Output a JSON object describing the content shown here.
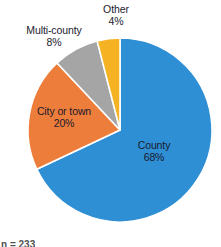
{
  "chart_data": {
    "type": "pie",
    "title": "",
    "subtitle": "",
    "xlabel": "",
    "ylabel": "",
    "legend_position": "none",
    "grid": false,
    "labels_show_percent": true,
    "categories": [
      "County",
      "City or town",
      "Multi-county",
      "Other"
    ],
    "values": [
      68,
      20,
      8,
      4
    ],
    "unit": "%",
    "start_angle_deg": 0,
    "direction": "clockwise",
    "slices": [
      {
        "label": "County",
        "value": 68,
        "value_text": "68%",
        "color": "#2e8fd4",
        "label_placement": "inside",
        "label_text_color": "#1a1a2e"
      },
      {
        "label": "City or town",
        "value": 20,
        "value_text": "20%",
        "color": "#ed7d3a",
        "label_placement": "inside",
        "label_text_color": "#1a1a2e"
      },
      {
        "label": "Multi-county",
        "value": 8,
        "value_text": "8%",
        "color": "#a5a5a5",
        "label_placement": "outside",
        "label_text_color": "#1a1a2e"
      },
      {
        "label": "Other",
        "value": 4,
        "value_text": "4%",
        "color": "#f5b324",
        "label_placement": "outside",
        "label_text_color": "#1a1a2e"
      }
    ]
  },
  "geometry": {
    "center_x": 120,
    "center_y": 130,
    "radius": 92,
    "separator_color": "#ffffff"
  },
  "caption": {
    "fragment_text": "n = 233"
  }
}
